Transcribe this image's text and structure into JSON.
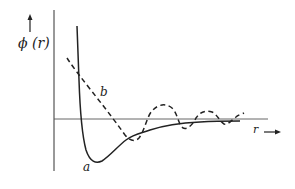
{
  "diagram": {
    "y_axis_label": "ϕ (r)",
    "x_axis_label": "r",
    "curve_a_label": "a",
    "curve_b_label": "b",
    "colors": {
      "ink": "#222222",
      "background": "#ffffff"
    },
    "curves": [
      {
        "name": "a",
        "style": "solid",
        "description": "potential with steep repulsive wall and single minimum, decaying to zero"
      },
      {
        "name": "b",
        "style": "dashed",
        "description": "softer decaying curve with oscillations about zero"
      }
    ]
  }
}
